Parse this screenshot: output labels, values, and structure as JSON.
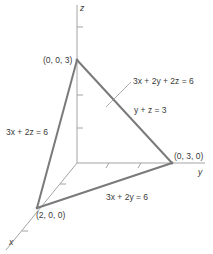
{
  "diagram": {
    "title": "",
    "axes": {
      "x": "x",
      "y": "y",
      "z": "z"
    },
    "points": {
      "z_intercept": "(0, 0, 3)",
      "y_intercept": "(0, 3, 0)",
      "x_intercept": "(2, 0, 0)"
    },
    "equations": {
      "plane": "3x + 2y + 2z = 6",
      "trace_yz": "y + z = 3",
      "trace_xz": "3x + 2z = 6",
      "trace_xy": "3x + 2y = 6"
    },
    "colors": {
      "edge": "#7a7a7a",
      "axis": "#9a9a9a",
      "text": "#3a3a3a"
    }
  }
}
